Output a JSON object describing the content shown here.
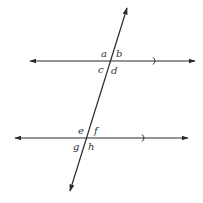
{
  "diagram": {
    "colors": {
      "line": "#2b2b2b",
      "label": "#333333",
      "background": "#ffffff"
    },
    "parallel_lines": [
      {
        "id": "upper",
        "x1": 30,
        "x2": 195,
        "y": 61,
        "parallel_mark_x": 156,
        "arrows": "both"
      },
      {
        "id": "lower",
        "x1": 15,
        "x2": 188,
        "y": 138,
        "parallel_mark_x": 145,
        "arrows": "both"
      }
    ],
    "transversal": {
      "x1": 127,
      "y1": 8,
      "x2": 70,
      "y2": 191,
      "arrows": "both"
    },
    "angle_labels": {
      "a": "a",
      "b": "b",
      "c": "c",
      "d": "d",
      "e": "e",
      "f": "f",
      "g": "g",
      "h": "h"
    }
  }
}
